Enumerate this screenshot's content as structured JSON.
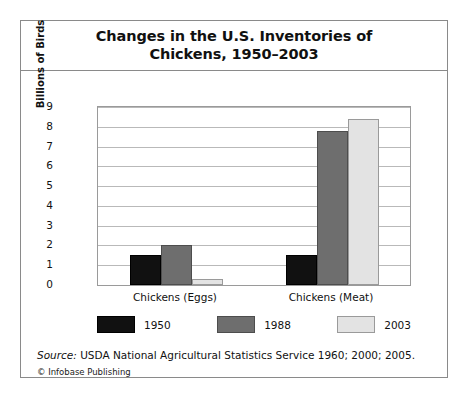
{
  "figure": {
    "title": "Changes in the U.S. Inventories of\nChickens, 1950–2003",
    "source_prefix": "Source:",
    "source_text": " USDA National Agricultural Statistics Service 1960; 2000; 2005.",
    "copyright": "© Infobase Publishing"
  },
  "chart_data": {
    "type": "bar",
    "title": "Changes in the U.S. Inventories of Chickens, 1950–2003",
    "xlabel": "",
    "ylabel": "Billions of Birds",
    "ylim": [
      0,
      9
    ],
    "yticks": [
      0,
      1,
      2,
      3,
      4,
      5,
      6,
      7,
      8,
      9
    ],
    "ytick_labels": [
      "0",
      "1",
      "2",
      "3",
      "4",
      "5",
      "6",
      "7",
      "8",
      "9"
    ],
    "grid": true,
    "legend_position": "bottom",
    "categories": [
      "Chickens (Eggs)",
      "Chickens (Meat)"
    ],
    "series": [
      {
        "name": "1950",
        "color": "#111111",
        "values": [
          1.5,
          1.5
        ]
      },
      {
        "name": "1988",
        "color": "#6e6e6e",
        "values": [
          2.0,
          7.8
        ]
      },
      {
        "name": "2003",
        "color": "#e3e3e3",
        "values": [
          0.3,
          8.4
        ]
      }
    ]
  }
}
